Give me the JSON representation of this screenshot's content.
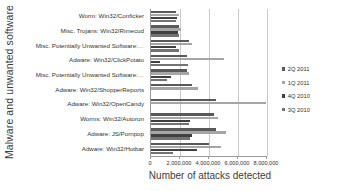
{
  "chart_data": {
    "type": "bar",
    "orientation": "horizontal",
    "title": "",
    "xlabel": "Number of attacks detected",
    "ylabel": "Malware and unwanted software",
    "xlim": [
      0,
      8000000
    ],
    "xticks": [
      0,
      2000000,
      4000000,
      6000000,
      8000000
    ],
    "xtick_labels": [
      "0",
      "2,000,000",
      "4,000,000",
      "6,000,000",
      "8,000,000"
    ],
    "grid": true,
    "legend_position": "right",
    "categories": [
      "Worm: Win32/Conficker",
      "Misc. Trojans: Win32/Rimecud",
      "Misc. Potentially Unwanted Software:…",
      "Adware: Win32/ClickPotato",
      "Misc. Potentially Unwanted Software:…",
      "Adware: Win32/ShopperReports",
      "Adware: Win32/OpenCandy",
      "Worms: Win32/Autorun",
      "Adware: JS/Pornpop",
      "Adware: Win32/Hotbar"
    ],
    "series": [
      {
        "name": "2Q 2011",
        "color": "#595959",
        "values": [
          1750000,
          1950000,
          2650000,
          2500000,
          2500000,
          2800000,
          4500000,
          4350000,
          4450000,
          4000000
        ]
      },
      {
        "name": "1Q 2011",
        "color": "#a6a6a6",
        "values": [
          1900000,
          2050000,
          2850000,
          5000000,
          2600000,
          3250000,
          7900000,
          4600000,
          5150000,
          4850000
        ]
      },
      {
        "name": "4Q 2010",
        "color": "#404040",
        "values": [
          1800000,
          1850000,
          1750000,
          600000,
          1400000,
          0,
          0,
          2700000,
          2850000,
          3200000
        ]
      },
      {
        "name": "3Q 2010",
        "color": "#737373",
        "values": [
          1700000,
          1900000,
          1900000,
          2550000,
          1100000,
          0,
          0,
          2600000,
          2700000,
          1550000
        ]
      }
    ]
  },
  "axes": {
    "y_title": "Malware and unwanted software",
    "x_title": "Number of attacks detected"
  },
  "legend": {
    "items": [
      {
        "label": "2Q 2011",
        "color": "#595959"
      },
      {
        "label": "1Q 2011",
        "color": "#a6a6a6"
      },
      {
        "label": "4Q 2010",
        "color": "#404040"
      },
      {
        "label": "3Q 2010",
        "color": "#737373"
      }
    ]
  }
}
